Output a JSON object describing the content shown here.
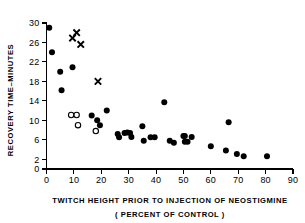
{
  "chart_data": {
    "type": "scatter",
    "title": "",
    "xlabel": "TWITCH HEIGHT PRIOR TO INJECTION OF NEOSTIGMINE",
    "xlabel_sub": "( PERCENT OF CONTROL )",
    "ylabel": "RECOVERY TIME–MINUTES",
    "xlim": [
      0,
      90
    ],
    "ylim": [
      0,
      30
    ],
    "xticks": [
      0,
      10,
      20,
      30,
      40,
      50,
      60,
      70,
      80,
      90
    ],
    "xticklabels": [
      "0",
      "10",
      "20",
      "30",
      "40",
      "50",
      "60",
      "70",
      "80",
      "90"
    ],
    "yticks": [
      0,
      2,
      6,
      10,
      14,
      18,
      22,
      26,
      30
    ],
    "yticklabels": [
      "0",
      "2",
      "6",
      "10",
      "14",
      "18",
      "22",
      "26",
      "30"
    ],
    "grid": false,
    "legend": null,
    "series": [
      {
        "name": "filled-circles",
        "marker": "filled-circle",
        "color": "#000000",
        "points": [
          [
            1.0,
            29.0
          ],
          [
            2.0,
            24.0
          ],
          [
            5.0,
            20.0
          ],
          [
            5.5,
            16.2
          ],
          [
            9.5,
            20.9
          ],
          [
            16.5,
            11.0
          ],
          [
            18.5,
            10.0
          ],
          [
            19.5,
            9.0
          ],
          [
            22.0,
            12.0
          ],
          [
            26.0,
            7.2
          ],
          [
            26.5,
            6.5
          ],
          [
            28.5,
            7.4
          ],
          [
            29.5,
            7.5
          ],
          [
            30.5,
            7.4
          ],
          [
            31.0,
            6.6
          ],
          [
            35.0,
            8.8
          ],
          [
            35.5,
            5.8
          ],
          [
            38.0,
            6.5
          ],
          [
            39.5,
            6.5
          ],
          [
            43.0,
            13.7
          ],
          [
            45.0,
            5.8
          ],
          [
            46.5,
            5.4
          ],
          [
            50.0,
            6.8
          ],
          [
            50.5,
            6.8
          ],
          [
            50.5,
            5.6
          ],
          [
            51.5,
            5.6
          ],
          [
            53.0,
            6.6
          ],
          [
            60.0,
            4.7
          ],
          [
            65.5,
            3.8
          ],
          [
            66.5,
            9.6
          ],
          [
            69.5,
            3.1
          ],
          [
            72.0,
            2.6
          ],
          [
            80.5,
            2.6
          ]
        ]
      },
      {
        "name": "open-circles",
        "marker": "open-circle",
        "color": "#000000",
        "points": [
          [
            9.0,
            11.1
          ],
          [
            11.0,
            11.1
          ],
          [
            11.5,
            9.0
          ],
          [
            18.0,
            7.8
          ]
        ]
      },
      {
        "name": "cross-markers",
        "marker": "x",
        "color": "#000000",
        "points": [
          [
            9.5,
            26.9
          ],
          [
            11.0,
            28.0
          ],
          [
            12.5,
            25.6
          ],
          [
            18.8,
            18.0
          ]
        ]
      }
    ]
  }
}
